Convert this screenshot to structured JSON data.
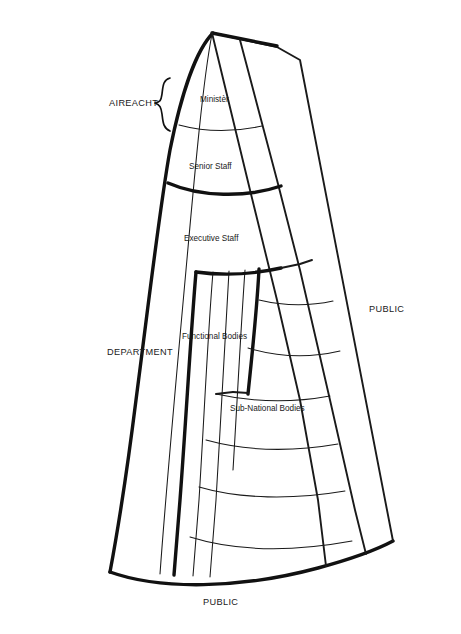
{
  "diagram": {
    "background_color": "#ffffff",
    "line_color": "#1a1a1a",
    "labels": {
      "aireacht": "AIREACHT",
      "minister": "Ministèr",
      "senior_staff": "Senior Staff",
      "executive_staff": "Executive Staff",
      "functional_bodies": "Functional Bodies",
      "sub_national_bodies": "Sub-National Bodies",
      "department": "DEPARTMENT",
      "public_right": "PUBLIC",
      "public_bottom": "PUBLIC"
    },
    "tiers": [
      {
        "id": "minister",
        "label": "Ministèr",
        "level": 1
      },
      {
        "id": "senior-staff",
        "label": "Senior Staff",
        "level": 2
      },
      {
        "id": "executive-staff",
        "label": "Executive Staff",
        "level": 3
      },
      {
        "id": "functional-bodies",
        "label": "Functional Bodies",
        "level": 4
      },
      {
        "id": "sub-national-bodies",
        "label": "Sub-National Bodies",
        "level": 5
      }
    ],
    "brackets": [
      {
        "id": "aireacht",
        "label": "AIREACHT",
        "side": "left"
      },
      {
        "id": "department",
        "label": "DEPARTMENT",
        "side": "left"
      }
    ],
    "outer_labels": [
      {
        "id": "public-right",
        "label": "PUBLIC",
        "position": "right"
      },
      {
        "id": "public-bottom",
        "label": "PUBLIC",
        "position": "bottom"
      }
    ]
  }
}
